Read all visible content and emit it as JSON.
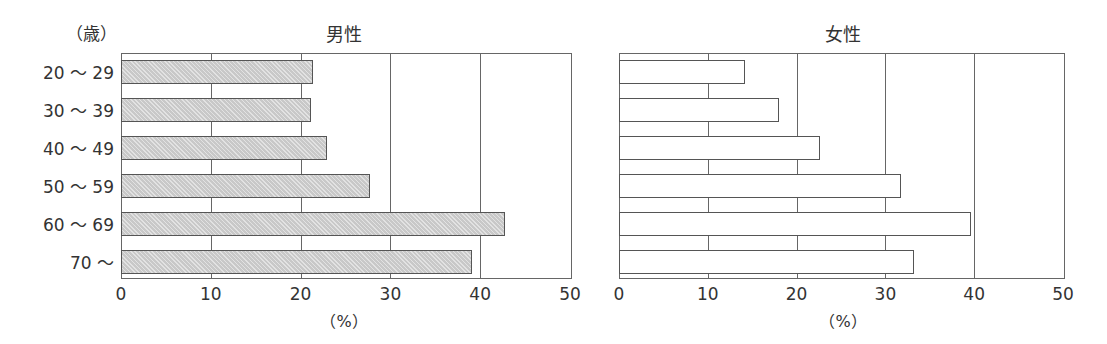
{
  "chart_data": [
    {
      "type": "bar",
      "orientation": "horizontal",
      "title": "男性",
      "categories": [
        "20～29",
        "30～39",
        "40～49",
        "50～59",
        "60～69",
        "70～"
      ],
      "values": [
        21.3,
        21.1,
        22.8,
        27.6,
        42.7,
        39.0
      ],
      "xlabel": "（%）",
      "ylabel": "（歳）",
      "xlim": [
        0,
        50
      ],
      "xticks": [
        0,
        10,
        20,
        30,
        40,
        50
      ],
      "grid": true,
      "bar_fill": "#d3d3d3",
      "bar_pattern": "hatched gray"
    },
    {
      "type": "bar",
      "orientation": "horizontal",
      "title": "女性",
      "categories": [
        "20～29",
        "30～39",
        "40～49",
        "50～59",
        "60～69",
        "70～"
      ],
      "values": [
        14.1,
        17.9,
        22.5,
        31.6,
        39.5,
        33.1
      ],
      "xlabel": "（%）",
      "xlim": [
        0,
        50
      ],
      "xticks": [
        0,
        10,
        20,
        30,
        40,
        50
      ],
      "grid": true,
      "bar_fill": "#ffffff",
      "bar_pattern": "none"
    }
  ],
  "labels": {
    "age_unit": "（歳）",
    "male_title": "男性",
    "female_title": "女性",
    "percent_unit": "（%）",
    "age_groups": [
      "20 ～ 29",
      "30 ～ 39",
      "40 ～ 49",
      "50 ～ 59",
      "60 ～ 69",
      "70 ～"
    ],
    "xticks": [
      "0",
      "10",
      "20",
      "30",
      "40",
      "50"
    ]
  },
  "colors": {
    "axis": "#666666",
    "text": "#333333",
    "male_bar": "#d3d3d3",
    "female_bar": "#ffffff",
    "bar_border": "#555555"
  }
}
